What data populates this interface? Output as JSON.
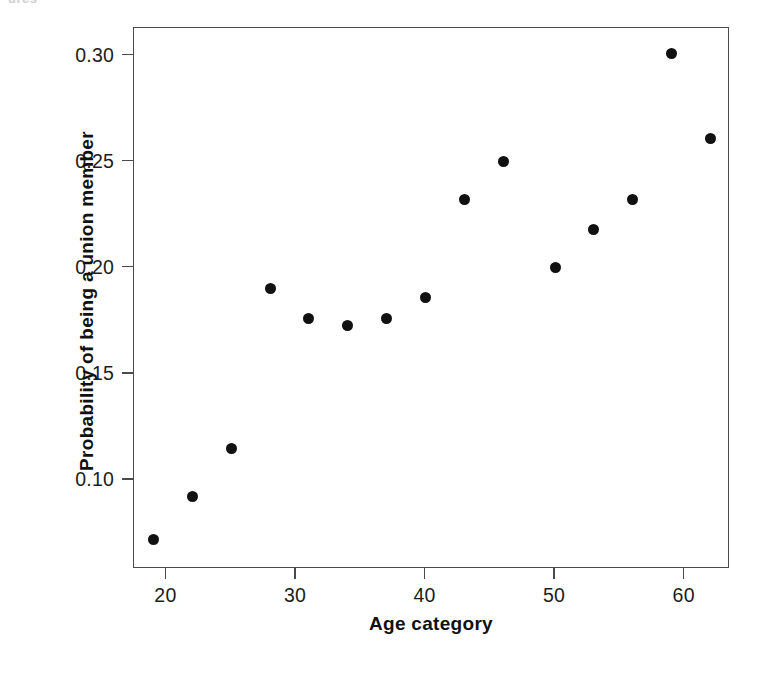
{
  "clipped_header_text": "ures",
  "chart_data": {
    "type": "scatter",
    "title": "",
    "xlabel": "Age category",
    "ylabel": "Probability of being a union member",
    "xlim": [
      17.5,
      63.5
    ],
    "ylim": [
      0.058,
      0.313
    ],
    "grid": false,
    "legend": null,
    "xticks": [
      20,
      30,
      40,
      50,
      60
    ],
    "xtick_labels": [
      "20",
      "30",
      "40",
      "50",
      "60"
    ],
    "yticks": [
      0.1,
      0.15,
      0.2,
      0.25,
      0.3
    ],
    "ytick_labels": [
      "0.10",
      "0.15",
      "0.20",
      "0.25",
      "0.30"
    ],
    "marker": "filled-circle",
    "marker_color": "#111111",
    "x": [
      19,
      22,
      25,
      28,
      31,
      34,
      37,
      40,
      43,
      46,
      50,
      53,
      56,
      59,
      62
    ],
    "y": [
      0.072,
      0.092,
      0.115,
      0.19,
      0.176,
      0.173,
      0.176,
      0.186,
      0.232,
      0.25,
      0.2,
      0.218,
      0.232,
      0.301,
      0.261
    ],
    "points": [
      {
        "x": 19,
        "y": 0.072
      },
      {
        "x": 22,
        "y": 0.092
      },
      {
        "x": 25,
        "y": 0.115
      },
      {
        "x": 28,
        "y": 0.19
      },
      {
        "x": 31,
        "y": 0.176
      },
      {
        "x": 34,
        "y": 0.173
      },
      {
        "x": 37,
        "y": 0.176
      },
      {
        "x": 40,
        "y": 0.186
      },
      {
        "x": 43,
        "y": 0.232
      },
      {
        "x": 46,
        "y": 0.25
      },
      {
        "x": 50,
        "y": 0.2
      },
      {
        "x": 53,
        "y": 0.218
      },
      {
        "x": 56,
        "y": 0.232
      },
      {
        "x": 59,
        "y": 0.301
      },
      {
        "x": 62,
        "y": 0.261
      }
    ]
  },
  "axis_color": "#4a4a4a"
}
